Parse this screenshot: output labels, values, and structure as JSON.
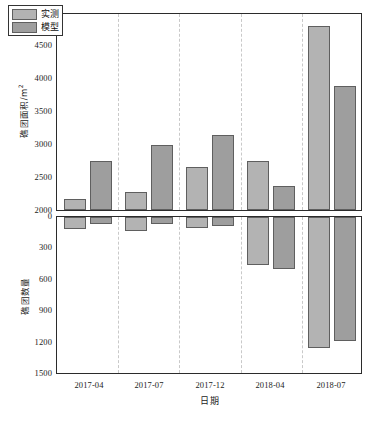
{
  "chart_data": [
    {
      "type": "bar",
      "panel": "top",
      "title": "",
      "xlabel": "",
      "ylabel": "礁团面积/m²",
      "ylabel_text": "礁团面积/m",
      "ylabel_sup": "2",
      "categories": [
        "2017-04",
        "2017-07",
        "2017-12",
        "2018-04",
        "2018-07"
      ],
      "ylim": [
        2000,
        5000
      ],
      "yticks": [
        2000,
        2500,
        3000,
        3500,
        4000,
        4500,
        5000
      ],
      "grid": "vertical-dashed",
      "legend_position": "upper-left",
      "series": [
        {
          "name": "实测",
          "color": "#b3b3b3",
          "values": [
            2160,
            2280,
            2650,
            2750,
            4790
          ]
        },
        {
          "name": "模型",
          "color": "#9e9e9e",
          "values": [
            2745,
            2990,
            3135,
            2365,
            3880
          ]
        }
      ]
    },
    {
      "type": "bar",
      "panel": "bottom",
      "title": "",
      "xlabel": "日期",
      "ylabel": "礁团数量",
      "categories": [
        "2017-04",
        "2017-07",
        "2017-12",
        "2018-04",
        "2018-07"
      ],
      "ylim": [
        0,
        1500
      ],
      "yticks": [
        0,
        300,
        600,
        900,
        1200,
        1500
      ],
      "y_inverted": true,
      "grid": "vertical-dashed",
      "series": [
        {
          "name": "实测",
          "color": "#b3b3b3",
          "values": [
            110,
            130,
            105,
            455,
            1240
          ]
        },
        {
          "name": "模型",
          "color": "#9e9e9e",
          "values": [
            65,
            70,
            85,
            490,
            1175
          ]
        }
      ]
    }
  ],
  "legend": {
    "items": [
      {
        "label": "实测",
        "color": "#b3b3b3"
      },
      {
        "label": "模型",
        "color": "#9e9e9e"
      }
    ]
  },
  "axes": {
    "top": {
      "ylabel_main": "礁团面积/m",
      "ylabel_sup": "2",
      "yticks": [
        "2000",
        "2500",
        "3000",
        "3500",
        "4000",
        "4500",
        "5000"
      ]
    },
    "bottom": {
      "ylabel": "礁团数量",
      "yticks": [
        "0",
        "300",
        "600",
        "900",
        "1200",
        "1500"
      ],
      "xticks": [
        "2017-04",
        "2017-07",
        "2017-12",
        "2018-04",
        "2018-07"
      ],
      "xlabel": "日期"
    }
  },
  "caption": ""
}
